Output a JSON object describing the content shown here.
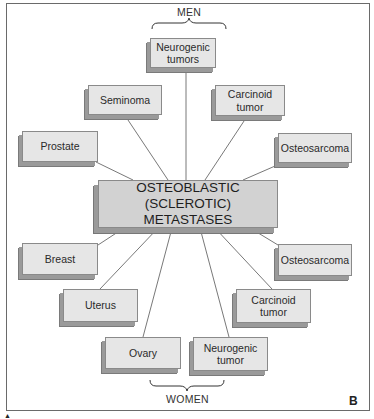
{
  "diagram": {
    "center": {
      "line1": "OSTEOBLASTIC (SCLEROTIC)",
      "line2": "METASTASES"
    },
    "groups": {
      "men_label": "MEN",
      "women_label": "WOMEN"
    },
    "men_nodes": [
      {
        "line1": "Neurogenic",
        "line2": "tumors"
      },
      {
        "line1": "Seminoma",
        "line2": ""
      },
      {
        "line1": "Carcinoid",
        "line2": "tumor"
      },
      {
        "line1": "Prostate",
        "line2": ""
      },
      {
        "line1": "Osteosarcoma",
        "line2": ""
      }
    ],
    "women_nodes": [
      {
        "line1": "Breast",
        "line2": ""
      },
      {
        "line1": "Osteosarcoma",
        "line2": ""
      },
      {
        "line1": "Uterus",
        "line2": ""
      },
      {
        "line1": "Carcinoid",
        "line2": "tumor"
      },
      {
        "line1": "Ovary",
        "line2": ""
      },
      {
        "line1": "Neurogenic",
        "line2": "tumor"
      }
    ],
    "panel_letter": "B",
    "corner_mark": "▲"
  }
}
